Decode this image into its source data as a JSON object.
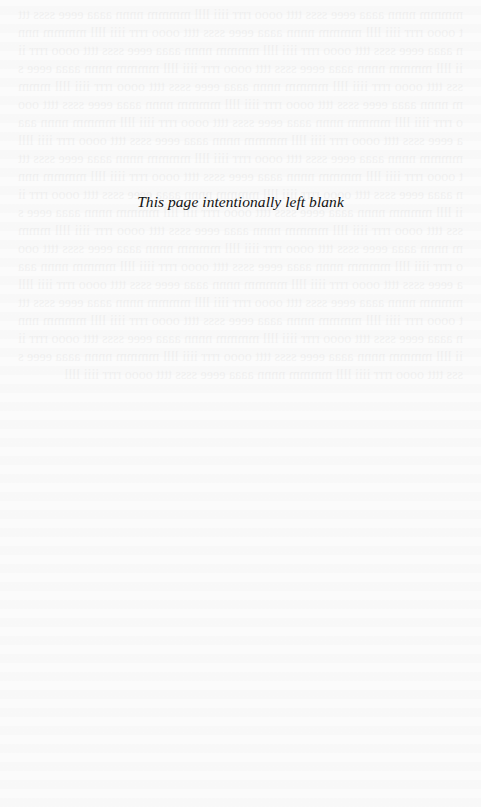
{
  "page": {
    "notice_text": "This page intentionally left blank",
    "background_color": "#fbfbfb",
    "text_color": "#111111"
  }
}
